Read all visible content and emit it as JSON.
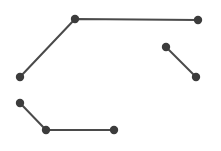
{
  "canvas": {
    "width": 221,
    "height": 151,
    "background": "#ffffff"
  },
  "style": {
    "stroke": "#4a4a4a",
    "fill": "#3c3c3c",
    "stroke_width": 2,
    "node_radius": 4.2
  },
  "polylines": [
    {
      "name": "polyline-top",
      "points": [
        [
          20,
          77
        ],
        [
          75,
          19
        ],
        [
          198,
          20
        ]
      ]
    },
    {
      "name": "polyline-right",
      "points": [
        [
          166,
          47
        ],
        [
          196,
          77
        ]
      ]
    },
    {
      "name": "polyline-bottom",
      "points": [
        [
          20,
          103
        ],
        [
          46,
          130
        ],
        [
          114,
          130
        ]
      ]
    }
  ]
}
